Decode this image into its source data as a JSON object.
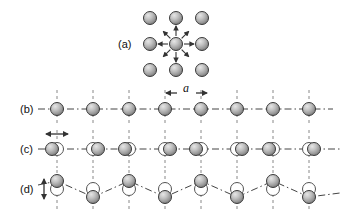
{
  "figure": {
    "background_color": "#ffffff",
    "width": 347,
    "height": 216,
    "atom": {
      "radius": 6.5,
      "fill_light": "#d8d8d8",
      "fill_mid": "#a8a8a8",
      "fill_dark": "#808080",
      "stroke": "#3a3a3a",
      "hollow_fill": "#ffffff",
      "hollow_stroke": "#555555"
    },
    "line_color": "#444444",
    "guide_color": "#888888"
  },
  "panels": [
    {
      "id": "a",
      "label": "(a)",
      "label_x": 118,
      "label_y": 48,
      "description": "two-dimensional square lattice with central atom and radial restoring-force arrows",
      "grid": {
        "columns_x": [
          150,
          176,
          202
        ],
        "rows_y": [
          18,
          44,
          70
        ],
        "center_x": 176,
        "center_y": 44
      },
      "arrows": {
        "count": 8,
        "directions": [
          "left",
          "up-left",
          "up",
          "up-right",
          "right",
          "down-right",
          "down",
          "down-left"
        ],
        "inner_radius": 8,
        "outer_radius": 18,
        "style": "outward"
      }
    },
    {
      "id": "b",
      "label": "(b)",
      "label_x": 20,
      "label_y": 113,
      "description": "equilibrium one-dimensional chain of atoms at lattice spacing a",
      "baseline_y": 109,
      "atom_x": [
        57,
        93,
        129,
        165,
        201,
        237,
        273,
        309
      ],
      "spacing": 36,
      "guides_x": [
        57,
        93,
        129,
        165,
        201,
        237,
        273,
        309
      ],
      "guide_top": 90,
      "guide_bottom": 126,
      "chain_start_x": 38,
      "chain_end_x": 333
    },
    {
      "id": "c",
      "label": "(c)",
      "label_x": 20,
      "label_y": 153,
      "description": "longitudinal wave: atoms displaced along the chain axis from equilibrium sites",
      "baseline_y": 149,
      "equilibrium_x": [
        57,
        93,
        129,
        165,
        201,
        237,
        273,
        309
      ],
      "displacements": [
        -5,
        5,
        -4,
        5,
        -5,
        5,
        -4,
        5
      ],
      "guide_top": 130,
      "guide_bottom": 168,
      "chain_start_x": 38,
      "chain_end_x": 340,
      "arrow": {
        "type": "double-headed-horizontal",
        "x": 57,
        "y": 134,
        "half_length": 10
      }
    },
    {
      "id": "d",
      "label": "(d)",
      "label_x": 20,
      "label_y": 193,
      "description": "transverse wave: atoms displaced perpendicular to the chain axis, traced by a wavy line",
      "baseline_y": 189,
      "equilibrium_x": [
        57,
        93,
        129,
        165,
        201,
        237,
        273,
        309
      ],
      "displacements_y": [
        -8,
        8,
        -8,
        8,
        -8,
        8,
        -8,
        8
      ],
      "guide_top": 170,
      "guide_bottom": 210,
      "chain_start_x": 38,
      "chain_end_x": 340,
      "arrow": {
        "type": "double-headed-vertical",
        "x": 44,
        "y": 189,
        "half_length": 10
      }
    }
  ],
  "annotations": {
    "lattice_constant": {
      "symbol": "a",
      "label_x": 190,
      "label_y": 97,
      "arrow_left_x": 165,
      "arrow_right_x": 201,
      "arrow_y": 97,
      "description": "lattice constant between adjacent equilibrium atom positions in panel (b)"
    }
  }
}
